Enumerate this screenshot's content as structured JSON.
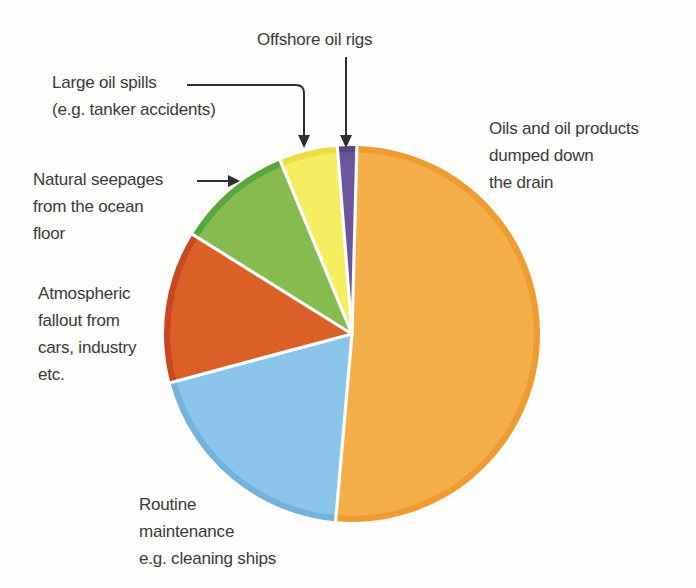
{
  "figure": {
    "background_color": "#FDFDFC",
    "text_color": "#3A3A3A",
    "arrow_color": "#2F2F2F"
  },
  "labels": {
    "offshore": "Offshore oil rigs",
    "spills": "Large oil spills\n(e.g. tanker accidents)",
    "seepages": "Natural seepages\nfrom the ocean\nfloor",
    "atmospheric": "Atmospheric\nfallout from\ncars, industry\netc.",
    "routine": "Routine\nmaintenance\ne.g. cleaning ships",
    "drain": "Oils and oil products\ndumped down\nthe drain"
  },
  "chart_data": {
    "type": "pie",
    "title": "",
    "legend_position": "callout-labels-around-pie",
    "grid": false,
    "slices": [
      {
        "label": "Oils and oil products dumped down the drain",
        "percent_est": 51.0,
        "start_deg": 1.5,
        "end_deg": 185.0,
        "color": "#F4AF49",
        "rim_color": "#EE9C31"
      },
      {
        "label": "Routine maintenance e.g. cleaning ships",
        "percent_est": 19.4,
        "start_deg": 185.0,
        "end_deg": 255.0,
        "color": "#8BC5E9",
        "rim_color": "#74B2DD"
      },
      {
        "label": "Atmospheric fallout from cars, industry etc.",
        "percent_est": 13.1,
        "start_deg": 255.0,
        "end_deg": 302.0,
        "color": "#DB6027",
        "rim_color": "#C8471E"
      },
      {
        "label": "Natural seepages from the ocean floor",
        "percent_est": 9.9,
        "start_deg": 302.0,
        "end_deg": 337.5,
        "color": "#85BB4F",
        "rim_color": "#58A63C"
      },
      {
        "label": "Large oil spills (e.g. tanker accidents)",
        "percent_est": 5.0,
        "start_deg": 337.5,
        "end_deg": 355.5,
        "color": "#F5EE60",
        "rim_color": "#EDDC45"
      },
      {
        "label": "Offshore oil rigs",
        "percent_est": 1.7,
        "start_deg": 355.5,
        "end_deg": 361.5,
        "color": "#6C5699",
        "rim_color": "#584684"
      }
    ],
    "geometry": {
      "cx": 352,
      "cy": 334,
      "r": 188,
      "rim_ratio": 0.967,
      "separator_color": "#FFFFFF",
      "separator_width": 3.2
    }
  }
}
